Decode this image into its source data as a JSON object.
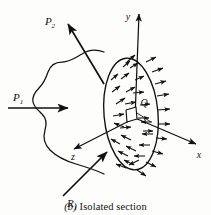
{
  "figure": {
    "caption_tag": "(b)",
    "caption_text": "Isolated section",
    "colors": {
      "ink": "#111111",
      "background": "#fdfdfc"
    },
    "body": {
      "name": "irregular-solid-body",
      "description": "Irregular blob-shaped body cut by a section plane"
    },
    "section": {
      "name": "cut-section-ellipse",
      "description": "Elliptical cut face covered with distributed internal force arrows",
      "arrow_count": 34
    },
    "area_element": {
      "label": "Q",
      "description": "Small parallelogram area element on the cut face"
    },
    "forces": [
      {
        "label": "P",
        "subscript": "1",
        "name": "force-p1",
        "direction": "right",
        "description": "Horizontal applied load entering body from the left"
      },
      {
        "label": "P",
        "subscript": "2",
        "name": "force-p2",
        "direction": "up-left",
        "description": "Inclined applied load at upper left"
      },
      {
        "label": "R",
        "subscript": "1",
        "name": "reaction-r1",
        "direction": "up-right",
        "description": "Reaction force at lower left"
      }
    ],
    "axes": [
      {
        "label": "y",
        "name": "axis-y",
        "direction": "up"
      },
      {
        "label": "x",
        "name": "axis-x",
        "direction": "down-right"
      },
      {
        "label": "z",
        "name": "axis-z",
        "direction": "down-left"
      }
    ]
  }
}
